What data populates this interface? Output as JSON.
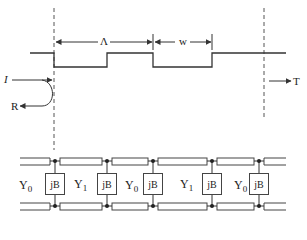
{
  "diagram": {
    "type": "periodic-structure",
    "colors": {
      "stroke": "#333333",
      "background": "#ffffff"
    },
    "waveform": {
      "dimension_labels": {
        "period": "Λ",
        "width": "w"
      }
    },
    "arrows": {
      "incident": "I",
      "reflected": "R",
      "transmitted": "T"
    },
    "circuit": {
      "shunt_label": "jB",
      "admittances": [
        {
          "main": "Y",
          "sub": "0"
        },
        {
          "main": "Y",
          "sub": "1"
        },
        {
          "main": "Y",
          "sub": "0"
        },
        {
          "main": "Y",
          "sub": "1"
        },
        {
          "main": "Y",
          "sub": "0"
        }
      ],
      "shunts": [
        "jB",
        "jB",
        "jB",
        "jB",
        "jB"
      ]
    }
  }
}
